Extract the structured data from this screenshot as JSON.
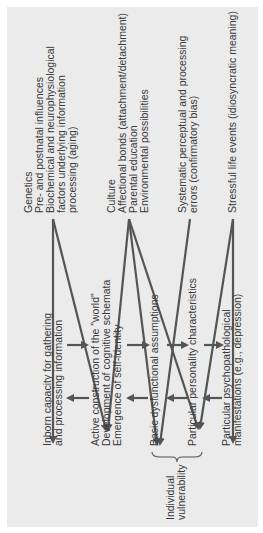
{
  "sources": {
    "biological": [
      "Genetics",
      "Pre- and postnatal influences",
      "Biochemical and neurophysiological",
      "factors underlying information",
      "processing (aging)"
    ],
    "social": [
      "Culture",
      "Affectional bonds (attachment/detachment)",
      "Parental education",
      "Environmental possibilities"
    ],
    "cognitive_errors": [
      "Systematic perceptual and processing",
      "errors (confirmatory bias)"
    ],
    "life_events": [
      "Stressful life events (idiosyncratic meaning)"
    ]
  },
  "stages": {
    "inborn": [
      "Inborn capacity for gathering",
      "and processing information"
    ],
    "construction": [
      "Active construction of the \"world\"",
      "Development of cognitive schemata",
      "Emergence of self-identity"
    ],
    "assumptions": [
      "Basic dysfunctional assumptions"
    ],
    "personality": [
      "Particular personality characteristics"
    ],
    "manifestations": [
      "Particular psychopathological",
      "manifestations (e.g., depression)"
    ]
  },
  "bracket_label": [
    "Individual",
    "vulnerability"
  ],
  "colors": {
    "panel": "#ebebeb",
    "ink": "#3a3a3a",
    "arrow": "#555555"
  }
}
